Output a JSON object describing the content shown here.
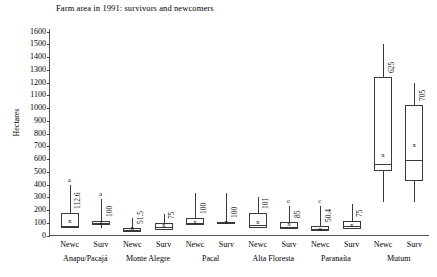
{
  "chart_data": {
    "type": "box",
    "title": "Farm area in 1991: survivors and newcomers",
    "xlabel": "",
    "ylabel": "Hectares",
    "ylim": [
      0,
      1600
    ],
    "ytick_values": [
      0,
      100,
      200,
      300,
      400,
      500,
      600,
      700,
      800,
      900,
      1000,
      1100,
      1200,
      1300,
      1400,
      1500,
      1600
    ],
    "ytick_labels": [
      "0",
      "100",
      "200",
      "300",
      "400",
      "500",
      "600",
      "700",
      "800",
      "900",
      "1000",
      "1100",
      "1200",
      "1300",
      "1400",
      "1500",
      "1600"
    ],
    "grid": false,
    "legend": "none",
    "categories": [
      "Anapu/Pacajá",
      "Monte Alegre",
      "Pacal",
      "Alta Floresta",
      "Paranaíta",
      "Mutum"
    ],
    "group_labels": [
      "Newc",
      "Surv"
    ],
    "boxes": [
      {
        "group": "Anapu/Pacajá",
        "subgroup": "Newc",
        "label": "112.6",
        "letter": "a",
        "q1": 60,
        "median": 75,
        "q3": 180,
        "whisker_low": 60,
        "whisker_high": 395,
        "mean": 112.6
      },
      {
        "group": "Anapu/Pacajá",
        "subgroup": "Surv",
        "label": "100",
        "letter": "a",
        "q1": 85,
        "median": 95,
        "q3": 110,
        "whisker_low": 60,
        "whisker_high": 285,
        "mean": 100
      },
      {
        "group": "Monte Alegre",
        "subgroup": "Newc",
        "label": "51.5",
        "letter": "",
        "q1": 25,
        "median": 40,
        "q3": 62,
        "whisker_low": 25,
        "whisker_high": 135,
        "mean": 51.5
      },
      {
        "group": "Monte Alegre",
        "subgroup": "Surv",
        "label": "75",
        "letter": "",
        "q1": 45,
        "median": 70,
        "q3": 100,
        "whisker_low": 45,
        "whisker_high": 165,
        "mean": 75
      },
      {
        "group": "Pacal",
        "subgroup": "Newc",
        "label": "100",
        "letter": "",
        "q1": 85,
        "median": 100,
        "q3": 135,
        "whisker_low": 85,
        "whisker_high": 330,
        "mean": 100
      },
      {
        "group": "Pacal",
        "subgroup": "Surv",
        "label": "100",
        "letter": "",
        "q1": 96,
        "median": 100,
        "q3": 104,
        "whisker_low": 96,
        "whisker_high": 330,
        "mean": 100
      },
      {
        "group": "Alta Floresta",
        "subgroup": "Newc",
        "label": "101",
        "letter": "",
        "q1": 55,
        "median": 80,
        "q3": 175,
        "whisker_low": 55,
        "whisker_high": 300,
        "mean": 101
      },
      {
        "group": "Alta Floresta",
        "subgroup": "Surv",
        "label": "85",
        "letter": "c",
        "q1": 50,
        "median": 70,
        "q3": 108,
        "whisker_low": 50,
        "whisker_high": 230,
        "mean": 85
      },
      {
        "group": "Paranaíta",
        "subgroup": "Newc",
        "label": "50.4",
        "letter": "c",
        "q1": 35,
        "median": 48,
        "q3": 78,
        "whisker_low": 35,
        "whisker_high": 235,
        "mean": 50.4
      },
      {
        "group": "Paranaíta",
        "subgroup": "Surv",
        "label": "75",
        "letter": "",
        "q1": 50,
        "median": 75,
        "q3": 115,
        "whisker_low": 50,
        "whisker_high": 245,
        "mean": 75
      },
      {
        "group": "Mutum",
        "subgroup": "Newc",
        "label": "625",
        "letter": "",
        "q1": 505,
        "median": 560,
        "q3": 1240,
        "whisker_low": 260,
        "whisker_high": 1505,
        "mean": 625
      },
      {
        "group": "Mutum",
        "subgroup": "Surv",
        "label": "705",
        "letter": "",
        "q1": 430,
        "median": 590,
        "q3": 1020,
        "whisker_low": 260,
        "whisker_high": 1200,
        "mean": 705
      }
    ],
    "mean_marker": "x"
  },
  "axis": {
    "y_title": "Hectares",
    "baseline_color": "#555555",
    "box_color": "#3a3a3a"
  }
}
